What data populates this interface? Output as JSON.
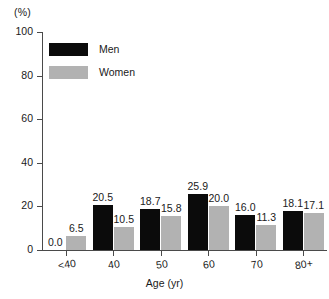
{
  "chart_data": {
    "type": "bar",
    "title": "",
    "subtitle": "",
    "unit_label": "(%)",
    "xlabel": "Age (yr)",
    "ylabel": "",
    "ylim": [
      0,
      100
    ],
    "yticks": [
      0,
      20,
      40,
      60,
      80,
      100
    ],
    "grid": false,
    "legend_position": "upper-left-inside",
    "categories": [
      "<40",
      "40",
      "50",
      "60",
      "70",
      "80+"
    ],
    "series": [
      {
        "name": "Men",
        "color": "#0b0b0b",
        "values": [
          0.0,
          20.5,
          18.7,
          25.9,
          16.0,
          18.1
        ],
        "labels": [
          "0.0",
          "20.5",
          "18.7",
          "25.9",
          "16.0",
          "18.1"
        ]
      },
      {
        "name": "Women",
        "color": "#b2b2b2",
        "values": [
          6.5,
          10.5,
          15.8,
          20.0,
          11.3,
          17.1
        ],
        "labels": [
          "6.5",
          "10.5",
          "15.8",
          "20.0",
          "11.3",
          "17.1"
        ]
      }
    ]
  },
  "axis": {
    "unit_label": "(%)",
    "y_tick_labels": [
      "0",
      "20",
      "40",
      "60",
      "80",
      "100"
    ],
    "x_tick_labels": [
      "<40",
      "40",
      "50",
      "60",
      "70",
      "80+"
    ],
    "x_title": "Age (yr)"
  },
  "legend": {
    "items": [
      {
        "label": "Men",
        "swatch": "men-swatch"
      },
      {
        "label": "Women",
        "swatch": "women-swatch"
      }
    ]
  }
}
